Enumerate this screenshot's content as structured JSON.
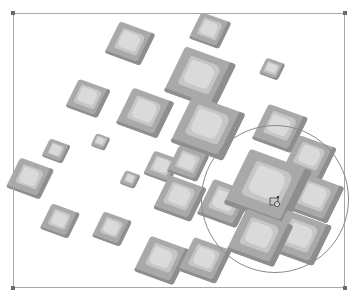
{
  "canvas": {
    "width": 361,
    "height": 301,
    "background": "#ffffff"
  },
  "selection_box": {
    "left": 13,
    "top": 13,
    "right": 345,
    "bottom": 288,
    "color": "#a8a8a8"
  },
  "brush_cursor": {
    "cx": 275,
    "cy": 199,
    "r": 74,
    "color": "#8a8a8a",
    "icon": "brush-clone-cursor-icon"
  },
  "tile_colors": {
    "body": "#a9a9a9",
    "shadow": "#8e8e8e",
    "face": "#c6c6c6",
    "highlight": "#dadada"
  },
  "tiles": [
    {
      "x": 130,
      "y": 45,
      "s": 38
    },
    {
      "x": 210,
      "y": 32,
      "s": 32
    },
    {
      "x": 88,
      "y": 100,
      "s": 34
    },
    {
      "x": 200,
      "y": 80,
      "s": 54
    },
    {
      "x": 272,
      "y": 70,
      "s": 20
    },
    {
      "x": 145,
      "y": 115,
      "s": 44
    },
    {
      "x": 208,
      "y": 130,
      "s": 56
    },
    {
      "x": 56,
      "y": 152,
      "s": 22
    },
    {
      "x": 100,
      "y": 142,
      "s": 15
    },
    {
      "x": 280,
      "y": 130,
      "s": 42
    },
    {
      "x": 310,
      "y": 160,
      "s": 40
    },
    {
      "x": 30,
      "y": 180,
      "s": 36
    },
    {
      "x": 130,
      "y": 180,
      "s": 16
    },
    {
      "x": 162,
      "y": 168,
      "s": 28
    },
    {
      "x": 188,
      "y": 165,
      "s": 32
    },
    {
      "x": 180,
      "y": 200,
      "s": 40
    },
    {
      "x": 225,
      "y": 205,
      "s": 42
    },
    {
      "x": 315,
      "y": 200,
      "s": 44
    },
    {
      "x": 268,
      "y": 190,
      "s": 66
    },
    {
      "x": 60,
      "y": 222,
      "s": 30
    },
    {
      "x": 112,
      "y": 230,
      "s": 30
    },
    {
      "x": 300,
      "y": 240,
      "s": 48
    },
    {
      "x": 260,
      "y": 240,
      "s": 50
    },
    {
      "x": 162,
      "y": 262,
      "s": 42
    },
    {
      "x": 205,
      "y": 262,
      "s": 40
    }
  ]
}
